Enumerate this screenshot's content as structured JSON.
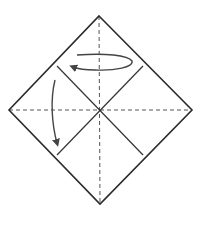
{
  "diagram": {
    "type": "origami-fold-diagram",
    "description": "Square sheet oriented as a diamond with dashed valley creases and crossed creases; arrows indicate folding",
    "colors": {
      "outline": "#2a2a2a",
      "crease": "#333333",
      "dashed": "#555555",
      "arrow": "#444444",
      "background": "#ffffff"
    },
    "paper": {
      "shape": "diamond",
      "vertices": {
        "top": [
          99,
          16
        ],
        "right": [
          192,
          110
        ],
        "bottom": [
          100,
          204
        ],
        "left": [
          9,
          110
        ]
      }
    },
    "dashed_creases": [
      {
        "name": "vertical-center-crease",
        "from": [
          99,
          16
        ],
        "to": [
          100,
          204
        ]
      },
      {
        "name": "horizontal-center-crease",
        "from": [
          9,
          110
        ],
        "to": [
          192,
          110
        ]
      }
    ],
    "solid_creases": [
      {
        "name": "diagonal-crease-a",
        "from": [
          57,
          66
        ],
        "to": [
          143,
          155
        ]
      },
      {
        "name": "diagonal-crease-b",
        "from": [
          143,
          66
        ],
        "to": [
          57,
          155
        ]
      }
    ],
    "arrows": [
      {
        "name": "rotate-arrow",
        "meaning": "turn / fold over (loop)",
        "direction": "counter-clockwise loop ending left"
      },
      {
        "name": "fold-down-arrow",
        "meaning": "fold down",
        "direction": "downward"
      }
    ]
  }
}
